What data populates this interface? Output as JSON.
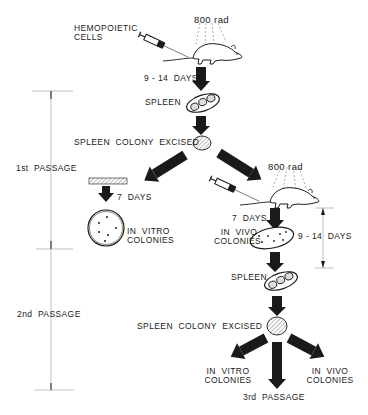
{
  "diagram": {
    "type": "flow",
    "colors": {
      "ink": "#1a1a1a",
      "background": "#ffffff",
      "hatch": "#888888"
    },
    "left_brackets": [
      {
        "label": "1st  PASSAGE",
        "y_top": 91,
        "y_bottom": 249
      },
      {
        "label": "2nd  PASSAGE",
        "y_top": 249,
        "y_bottom": 390
      }
    ],
    "right_bracket": {
      "label": "9 - 14  DAYS",
      "y_top": 208,
      "y_bottom": 268
    },
    "labels": {
      "hemopoietic": "HEMOPOIETIC",
      "cells": "CELLS",
      "rad_1": "800 rad",
      "days_9_14_top": "9 - 14  DAYS",
      "spleen_1": "SPLEEN",
      "colony_excised_1": "SPLEEN  COLONY  EXCISED",
      "days_7_left": "7  DAYS",
      "in_vitro_1a": "IN  VITRO",
      "in_vitro_1b": "COLONIES",
      "rad_2": "800 rad",
      "days_7_right": "7  DAYS",
      "in_vivo_2a": "IN  VIVO",
      "in_vivo_2b": "COLONIES",
      "days_9_14_right": "9 - 14  DAYS",
      "spleen_2": "SPLEEN",
      "colony_excised_2": "SPLEEN  COLONY  EXCISED",
      "in_vitro_3a": "IN  VITRO",
      "in_vitro_3b": "COLONIES",
      "in_vivo_3a": "IN  VIVO",
      "in_vivo_3b": "COLONIES",
      "passage_3": "3rd  PASSAGE",
      "passage_1": "1st  PASSAGE",
      "passage_2": "2nd  PASSAGE"
    },
    "nodes": [
      "syringe-1",
      "mouse-1",
      "spleen-1",
      "excised-colony-1",
      "culture-dish",
      "petri-dish",
      "syringe-2",
      "mouse-2",
      "in-vivo-spleen",
      "spleen-2",
      "excised-colony-2"
    ]
  }
}
